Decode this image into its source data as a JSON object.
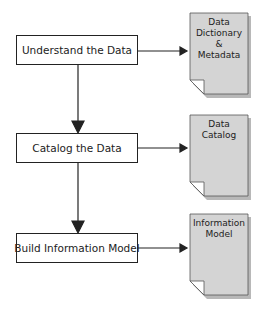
{
  "diagram": {
    "process_steps": [
      {
        "label": "Understand the Data"
      },
      {
        "label": "Catalog the Data"
      },
      {
        "label": "Build Information Model"
      }
    ],
    "documents": [
      {
        "lines": [
          "Data",
          "Dictionary",
          "&",
          "Metadata"
        ]
      },
      {
        "lines": [
          "Data",
          "Catalog"
        ]
      },
      {
        "lines": [
          "Information",
          "Model"
        ]
      }
    ],
    "colors": {
      "document_fill": "#d4d4d4",
      "document_shadow": "#9a9a9a",
      "line": "#222222"
    }
  }
}
